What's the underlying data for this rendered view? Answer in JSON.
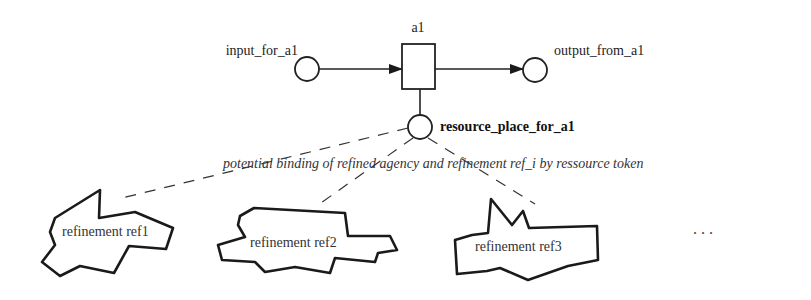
{
  "diagram": {
    "transition": {
      "label": "a1"
    },
    "input_place": {
      "label": "input_for_a1"
    },
    "output_place": {
      "label": "output_from_a1"
    },
    "resource_place": {
      "label": "resource_place_for_a1"
    },
    "binding_annotation": "potential binding of refined agency and refinement ref_i by ressource token",
    "refinements": [
      {
        "label": "refinement ref1"
      },
      {
        "label": "refinement ref2"
      },
      {
        "label": "refinement ref3"
      }
    ],
    "ellipsis": "..."
  }
}
